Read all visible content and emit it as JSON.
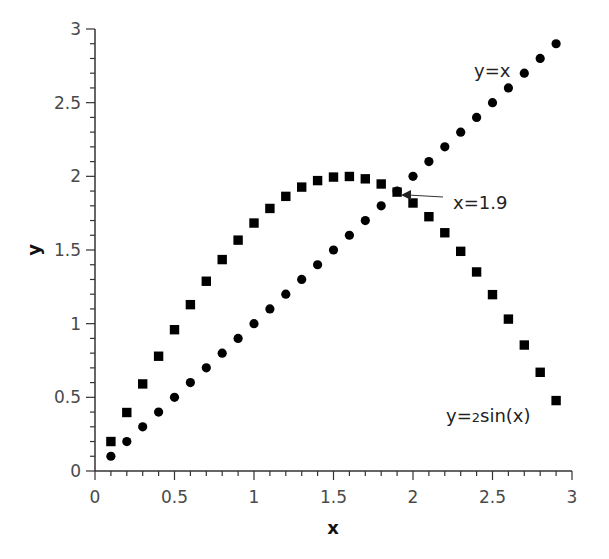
{
  "chart_data": {
    "type": "scatter",
    "title": "",
    "xlabel": "x",
    "ylabel": "y",
    "xlim": [
      0,
      3
    ],
    "ylim": [
      0,
      3
    ],
    "grid": false,
    "legend": null,
    "x_ticks": [
      "0",
      "0.5",
      "1",
      "1.5",
      "2",
      "2.5",
      "3"
    ],
    "y_ticks": [
      "0",
      "0.5",
      "1",
      "1.5",
      "2",
      "2.5",
      "3"
    ],
    "x_minor_step": 0.1,
    "y_minor_step": 0.1,
    "x": [
      0.1,
      0.2,
      0.3,
      0.4,
      0.5,
      0.6,
      0.7,
      0.8,
      0.9,
      1.0,
      1.1,
      1.2,
      1.3,
      1.4,
      1.5,
      1.6,
      1.7,
      1.8,
      1.9,
      2.0,
      2.1,
      2.2,
      2.3,
      2.4,
      2.5,
      2.6,
      2.7,
      2.8,
      2.9
    ],
    "series": [
      {
        "name": "y=x",
        "marker": "circle",
        "color": "#000000",
        "values": [
          0.1,
          0.2,
          0.3,
          0.4,
          0.5,
          0.6,
          0.7,
          0.8,
          0.9,
          1.0,
          1.1,
          1.2,
          1.3,
          1.4,
          1.5,
          1.6,
          1.7,
          1.8,
          1.9,
          2.0,
          2.1,
          2.2,
          2.3,
          2.4,
          2.5,
          2.6,
          2.7,
          2.8,
          2.9
        ]
      },
      {
        "name": "y=2sin(x)",
        "marker": "square",
        "color": "#000000",
        "values": [
          0.2,
          0.397,
          0.591,
          0.779,
          0.959,
          1.129,
          1.288,
          1.435,
          1.567,
          1.683,
          1.782,
          1.864,
          1.927,
          1.971,
          1.995,
          1.999,
          1.983,
          1.948,
          1.893,
          1.819,
          1.726,
          1.617,
          1.491,
          1.351,
          1.197,
          1.031,
          0.855,
          0.67,
          0.478
        ]
      }
    ],
    "annotations": [
      {
        "text": "y=x",
        "x": 2.43,
        "y": 2.72
      },
      {
        "text_prefix": "y=",
        "text_small": "2",
        "text_suffix": "sin(x)",
        "x": 2.22,
        "y": 0.33
      },
      {
        "text": "x=1.9",
        "x": 2.25,
        "y": 1.85,
        "arrow_to": {
          "x": 1.94,
          "y": 1.88
        }
      }
    ]
  }
}
